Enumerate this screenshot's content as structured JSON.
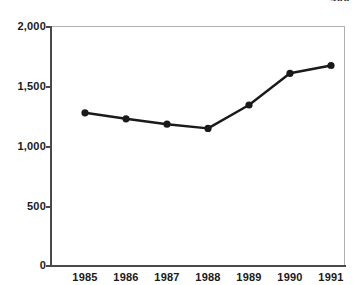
{
  "corner": {
    "number": "400"
  },
  "chart_data": {
    "type": "line",
    "title": "",
    "subtitle": "",
    "xlabel": "",
    "ylabel": "",
    "categories": [
      "1985",
      "1986",
      "1987",
      "1988",
      "1989",
      "1990",
      "1991"
    ],
    "values": [
      1275,
      1225,
      1180,
      1145,
      1340,
      1605,
      1670
    ],
    "series": [
      {
        "name": "series-1",
        "values": [
          1275,
          1225,
          1180,
          1145,
          1340,
          1605,
          1670
        ],
        "color": "#1a1a1a",
        "marker": "circle"
      }
    ],
    "ylim": [
      0,
      2000
    ],
    "yticks": [
      0,
      500,
      1000,
      1500,
      2000
    ],
    "ytick_labels": [
      "0",
      "500",
      "1,000",
      "1,500",
      "2,000"
    ],
    "xtick_labels": [
      "1985",
      "1986",
      "1987",
      "1988",
      "1989",
      "1990",
      "1991"
    ],
    "grid": false,
    "legend": false,
    "legend_position": "none",
    "frame_color": "#b0b0b0",
    "axis_color": "#4a4a4a",
    "line_color": "#1a1a1a",
    "background": "#ffffff"
  }
}
